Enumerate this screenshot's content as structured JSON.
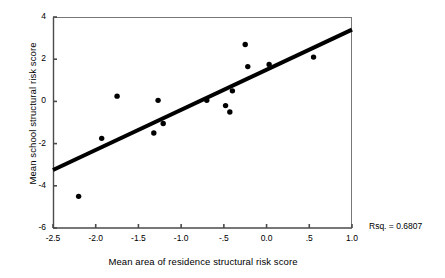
{
  "chart_data": {
    "type": "scatter",
    "title": "",
    "xlabel": "Mean area of residence structural risk score",
    "ylabel": "Mean school structural risk score",
    "xlim": [
      -2.5,
      1.0
    ],
    "ylim": [
      -6,
      4
    ],
    "grid": false,
    "legend": null,
    "x_ticks": [
      -2.5,
      -2.0,
      -1.5,
      -1.0,
      -0.5,
      0.0,
      0.5,
      1.0
    ],
    "x_tick_labels": [
      "-2.5",
      "-2.0",
      "-1.5",
      "-1.0",
      "-.5",
      "0.0",
      ".5",
      "1.0"
    ],
    "y_ticks": [
      4,
      2,
      0,
      -2,
      -4,
      -6
    ],
    "y_tick_labels": [
      "4",
      "2",
      "0",
      "-2",
      "-4",
      "-6"
    ],
    "points": [
      {
        "x": -2.2,
        "y": -4.5
      },
      {
        "x": -1.93,
        "y": -1.75
      },
      {
        "x": -1.75,
        "y": 0.25
      },
      {
        "x": -1.32,
        "y": -1.5
      },
      {
        "x": -1.27,
        "y": 0.05
      },
      {
        "x": -1.21,
        "y": -1.05
      },
      {
        "x": -0.7,
        "y": 0.05
      },
      {
        "x": -0.48,
        "y": -0.2
      },
      {
        "x": -0.43,
        "y": -0.5
      },
      {
        "x": -0.4,
        "y": 0.5
      },
      {
        "x": -0.25,
        "y": 2.7
      },
      {
        "x": -0.22,
        "y": 1.65
      },
      {
        "x": 0.03,
        "y": 1.75
      },
      {
        "x": 0.55,
        "y": 2.1
      }
    ],
    "fit_line": {
      "label": "regression-line",
      "x_start": -2.5,
      "y_start": -3.25,
      "x_end": 1.0,
      "y_end": 3.4
    },
    "annotations": [
      {
        "name": "r-squared",
        "text": "Rsq. = 0.6807"
      }
    ]
  }
}
